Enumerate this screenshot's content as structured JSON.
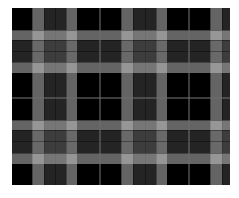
{
  "image": {
    "subject": "black, gray and white plaid (tartan) fabric pattern",
    "background": "#ffffff",
    "pattern_box": {
      "x": 12,
      "y": 8,
      "width": 218,
      "height": 177
    }
  },
  "palette": {
    "black": "#000000",
    "light_stripe": "rgba(200,200,200,0.50)",
    "dark_stripe": "rgba(120,120,120,0.30)",
    "thin_line": "rgba(110,110,110,0.55)",
    "divider": "rgba(0,0,0,0.35)"
  },
  "vertical_bands": [
    {
      "x": 20,
      "w": 12,
      "tone": "light"
    },
    {
      "x": 32,
      "w": 11,
      "tone": "dark"
    },
    {
      "x": 43,
      "w": 11,
      "tone": "dark"
    },
    {
      "x": 54,
      "w": 11,
      "tone": "light"
    },
    {
      "x": 109,
      "w": 12,
      "tone": "light"
    },
    {
      "x": 121,
      "w": 12,
      "tone": "dark"
    },
    {
      "x": 133,
      "w": 11,
      "tone": "dark"
    },
    {
      "x": 144,
      "w": 11,
      "tone": "light"
    },
    {
      "x": 198,
      "w": 12,
      "tone": "light"
    },
    {
      "x": 210,
      "w": 8,
      "tone": "dark"
    }
  ],
  "horizontal_bands": [
    {
      "y": 22,
      "h": 10,
      "tone": "light"
    },
    {
      "y": 32,
      "h": 11,
      "tone": "dark"
    },
    {
      "y": 43,
      "h": 11,
      "tone": "dark"
    },
    {
      "y": 54,
      "h": 11,
      "tone": "light"
    },
    {
      "y": 112,
      "h": 10,
      "tone": "light"
    },
    {
      "y": 122,
      "h": 11,
      "tone": "dark"
    },
    {
      "y": 133,
      "h": 12,
      "tone": "dark"
    },
    {
      "y": 145,
      "h": 11,
      "tone": "light"
    }
  ],
  "thin_lines": {
    "vertical_x": [
      87,
      176
    ],
    "horizontal_y": [
      89
    ]
  }
}
